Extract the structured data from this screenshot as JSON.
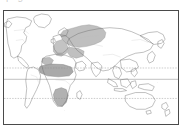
{
  "figure": {
    "kind": "world-map",
    "caption_fragment": "p  g",
    "frame": {
      "x": 3,
      "y": 10,
      "width": 176,
      "height": 115
    },
    "border_color": "#4a4a4a",
    "background_color": "#ffffff"
  },
  "map": {
    "projection": "equirectangular",
    "coastline_color": "#6b6b6b",
    "shading_color": "#a9a9a9",
    "shading_stroke": "#7a7a7a",
    "latitude_lines": [
      {
        "name": "Tropic of Cancer",
        "style": "dashed",
        "color": "#8c8c8c",
        "y_pct": 50.5
      },
      {
        "name": "Equator",
        "style": "solid",
        "color": "#8c8c8c",
        "y_pct": 60.5
      },
      {
        "name": "Tropic of Capricorn",
        "style": "dashed",
        "color": "#8c8c8c",
        "y_pct": 77.5
      }
    ],
    "shaded_regions": [
      {
        "label": "Europe and western Eurasia",
        "fill": "#b4b4b4"
      },
      {
        "label": "Sahel belt of Africa",
        "fill": "#a0a0a0"
      },
      {
        "label": "Southern Africa",
        "fill": "#a8a8a8"
      },
      {
        "label": "Northwest Africa",
        "fill": "#b0b0b0"
      }
    ],
    "landmasses": [
      "North America",
      "South America",
      "Greenland",
      "Europe",
      "Africa",
      "Asia",
      "Australia",
      "New Zealand",
      "Japan",
      "Indonesia",
      "Madagascar",
      "British Isles"
    ]
  }
}
